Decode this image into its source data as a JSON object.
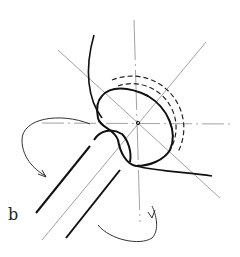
{
  "figure": {
    "panel_label": "b",
    "colors": {
      "ink": "#1a1a1a",
      "thin": "#8a8a8a",
      "background": "#ffffff"
    }
  }
}
